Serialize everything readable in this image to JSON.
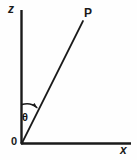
{
  "diagram": {
    "axes": {
      "vertical": {
        "label": "z",
        "icon": "z-axis-line"
      },
      "horizontal": {
        "label": "x",
        "icon": "x-axis-line"
      }
    },
    "origin": {
      "label": "0"
    },
    "point": {
      "label": "P"
    },
    "angle": {
      "label": "θ",
      "icon": "angle-arc-arrow"
    },
    "ray": {
      "icon": "ray-line"
    },
    "colors": {
      "stroke": "#1a1a1a",
      "background": "#fefefe",
      "text": "#1a1a1a"
    }
  }
}
